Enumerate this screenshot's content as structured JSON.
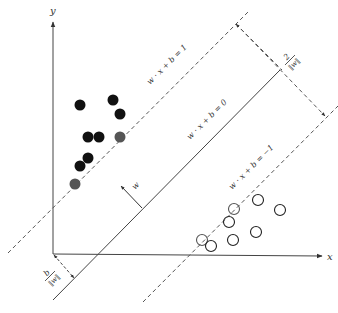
{
  "diagram": {
    "type": "svm-max-margin",
    "axes": {
      "x_label": "x",
      "y_label": "y"
    },
    "lines": {
      "hyperplane_label": "w · x + b = 0",
      "upper_margin_label": "w · x + b = 1",
      "lower_margin_label": "w · x + b = −1"
    },
    "annotations": {
      "normal_vector_label": "w",
      "margin_numerator": "2",
      "margin_denominator": "‖w‖",
      "offset_numerator": "b",
      "offset_denominator": "‖w‖"
    },
    "colors": {
      "ink": "#333333",
      "filled_point": "#111111",
      "support_vector_filled": "#555555",
      "hollow_point_stroke": "#222222",
      "support_vector_hollow": "#555555"
    },
    "class_positive_points": [
      {
        "x": 80,
        "y": 105,
        "support": false
      },
      {
        "x": 113,
        "y": 100,
        "support": false
      },
      {
        "x": 120,
        "y": 114,
        "support": false
      },
      {
        "x": 88,
        "y": 137,
        "support": false
      },
      {
        "x": 99,
        "y": 137,
        "support": false
      },
      {
        "x": 120,
        "y": 137,
        "support": true
      },
      {
        "x": 88,
        "y": 158,
        "support": false
      },
      {
        "x": 80,
        "y": 166,
        "support": false
      },
      {
        "x": 75,
        "y": 184,
        "support": true
      }
    ],
    "class_negative_points": [
      {
        "x": 258,
        "y": 200,
        "support": false
      },
      {
        "x": 234,
        "y": 209,
        "support": true
      },
      {
        "x": 280,
        "y": 210,
        "support": false
      },
      {
        "x": 229,
        "y": 222,
        "support": false
      },
      {
        "x": 256,
        "y": 232,
        "support": false
      },
      {
        "x": 233,
        "y": 240,
        "support": false
      },
      {
        "x": 202,
        "y": 240,
        "support": true
      },
      {
        "x": 211,
        "y": 246,
        "support": false
      }
    ]
  }
}
